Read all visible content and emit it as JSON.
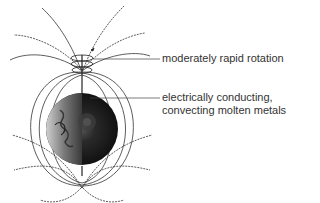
{
  "figure": {
    "labels": {
      "rotation": "moderately rapid rotation",
      "core_line1": "electrically conducting,",
      "core_line2": "convecting molten metals"
    },
    "colors": {
      "field_lines": "#333333",
      "earth_core_dark": "#1a1a1a",
      "earth_surface": "#8a8a8a",
      "text": "#333333"
    }
  }
}
